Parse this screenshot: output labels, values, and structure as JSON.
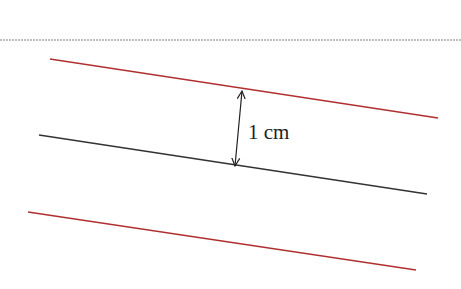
{
  "diagram": {
    "separator": {
      "y": 40,
      "color": "#aaaaaa"
    },
    "lines": [
      {
        "name": "top-offset-line",
        "x1": 50,
        "y1": 59,
        "x2": 438,
        "y2": 118,
        "color": "#b03030"
      },
      {
        "name": "center-line",
        "x1": 39,
        "y1": 135,
        "x2": 427,
        "y2": 194,
        "color": "#333333"
      },
      {
        "name": "bottom-offset-line",
        "x1": 28,
        "y1": 212,
        "x2": 416,
        "y2": 270,
        "color": "#b03030"
      }
    ],
    "dimension_arrow": {
      "x1": 242,
      "y1": 91,
      "x2": 235,
      "y2": 166,
      "color": "#222222"
    },
    "dimension_label": "1 cm"
  }
}
